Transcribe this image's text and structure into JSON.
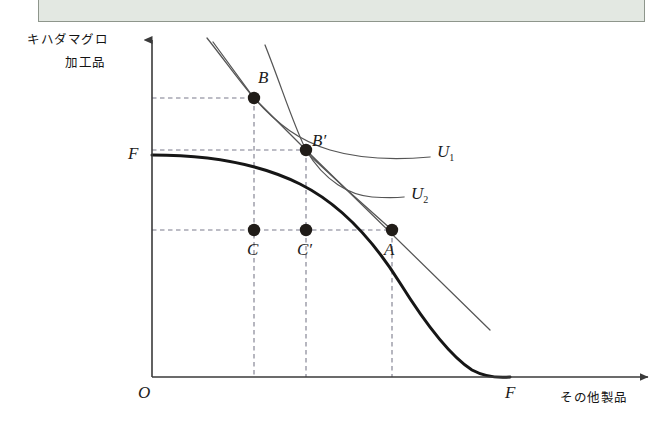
{
  "figure": {
    "type": "economics-ppf-indifference-diagram",
    "background_color": "#ffffff",
    "banner": {
      "name": "top-banner-bar",
      "fill_color": "#e3e8e2",
      "border_color": "#8e968c"
    },
    "axes": {
      "origin_label": "O",
      "y_axis_label_line1": "キハダマグロ",
      "y_axis_label_line2": "加工品",
      "x_axis_label": "その他製品",
      "y_axis_intercept_label": "F",
      "x_axis_intercept_label": "F",
      "axis_color": "#3a3a3a"
    },
    "points": [
      {
        "id": "B",
        "label": "B",
        "x": 254,
        "y": 98
      },
      {
        "id": "Bp",
        "label": "B′",
        "x": 306,
        "y": 150
      },
      {
        "id": "C",
        "label": "C",
        "x": 254,
        "y": 230
      },
      {
        "id": "Cp",
        "label": "C′",
        "x": 306,
        "y": 230
      },
      {
        "id": "A",
        "label": "A",
        "x": 392,
        "y": 230
      }
    ],
    "curves": [
      {
        "id": "ppf",
        "name": "production-possibility-frontier",
        "color": "#1b1b1b",
        "width": 3.0
      },
      {
        "id": "u1",
        "name": "indifference-curve-u1",
        "label": "U₁",
        "color": "#4a4a4a",
        "width": 1.2
      },
      {
        "id": "u2",
        "name": "indifference-curve-u2",
        "label": "U₂",
        "color": "#4a4a4a",
        "width": 1.2
      },
      {
        "id": "budget-through-b",
        "name": "price-line-through-b",
        "color": "#4a4a4a",
        "width": 1.2
      },
      {
        "id": "budget-through-bp",
        "name": "price-line-through-bprime",
        "color": "#4a4a4a",
        "width": 1.2
      }
    ],
    "curve_labels": {
      "u1": "U",
      "u1_sub": "1",
      "u2": "U",
      "u2_sub": "2"
    },
    "guide_lines": {
      "color": "#7a7a8a",
      "style": "dashed",
      "horizontal_rows": [
        98,
        150,
        230
      ],
      "vertical_columns": [
        254,
        306,
        392
      ]
    }
  }
}
